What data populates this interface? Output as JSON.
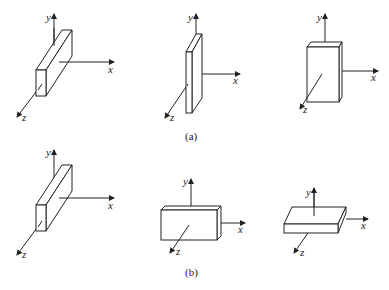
{
  "figure": {
    "axis_labels": {
      "x": "x",
      "y": "y",
      "z": "z"
    },
    "captions": {
      "a": "(a)",
      "b": "(b)"
    },
    "rows": [
      {
        "caption": "(a)",
        "panels": [
          "thin plate long along y-z diagonal",
          "thin plate tall along y",
          "block tall along y"
        ]
      },
      {
        "caption": "(b)",
        "panels": [
          "thin plate long along y-z diagonal",
          "block wide along x",
          "flat plate thin along y"
        ]
      }
    ],
    "colors": {
      "stroke": "#222222",
      "background": "#ffffff"
    }
  }
}
